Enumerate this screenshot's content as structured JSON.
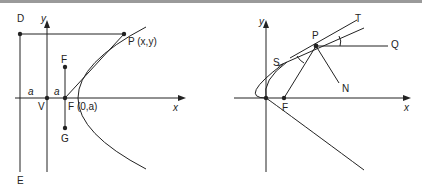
{
  "left_diagram": {
    "labels": {
      "D": "D",
      "E": "E",
      "y": "y",
      "x": "x",
      "P": "P (x,y)",
      "F_upper": "F",
      "G": "G",
      "V": "V",
      "F_focus": "F (0,a)",
      "a_left": "a",
      "a_right": "a"
    }
  },
  "right_diagram": {
    "labels": {
      "y": "y",
      "x": "x",
      "P": "P",
      "T": "T",
      "Q": "Q",
      "S": "S",
      "N": "N",
      "F": "F"
    }
  },
  "colors": {
    "line": "#222222",
    "topbar": "#9a9a9a"
  }
}
